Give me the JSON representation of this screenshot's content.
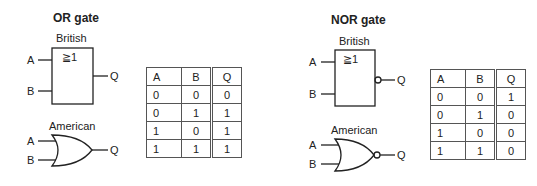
{
  "panels": [
    {
      "title": "OR gate",
      "british_label": "British",
      "british_symbol": "≧1",
      "american_label": "American",
      "inputs": [
        "A",
        "B"
      ],
      "output": "Q",
      "table": {
        "headers": [
          "A",
          "B",
          "Q"
        ],
        "rows": [
          [
            "0",
            "0",
            "0"
          ],
          [
            "0",
            "1",
            "1"
          ],
          [
            "1",
            "0",
            "1"
          ],
          [
            "1",
            "1",
            "1"
          ]
        ]
      }
    },
    {
      "title": "NOR gate",
      "british_label": "British",
      "british_symbol": "≧1",
      "american_label": "American",
      "inputs": [
        "A",
        "B"
      ],
      "output": "Q",
      "table": {
        "headers": [
          "A",
          "B",
          "Q"
        ],
        "rows": [
          [
            "0",
            "0",
            "1"
          ],
          [
            "0",
            "1",
            "0"
          ],
          [
            "1",
            "0",
            "0"
          ],
          [
            "1",
            "1",
            "0"
          ]
        ]
      }
    }
  ]
}
